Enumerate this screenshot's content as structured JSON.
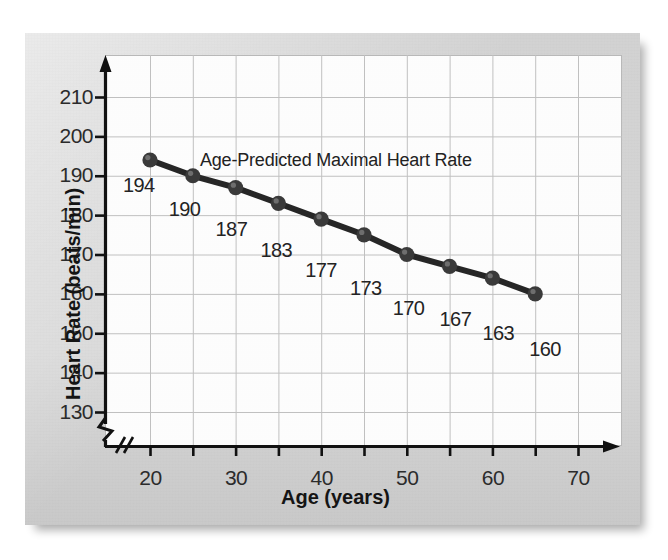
{
  "chart_data": {
    "type": "line",
    "title": "Age-Predicted Maximal Heart Rate",
    "xlabel": "Age (years)",
    "ylabel": "Heart Rate (beats/min)",
    "xlim": [
      15,
      72
    ],
    "ylim": [
      126,
      214
    ],
    "x": [
      20,
      25,
      30,
      35,
      40,
      45,
      50,
      55,
      60,
      65
    ],
    "values": [
      194,
      190,
      187,
      183,
      179,
      175,
      170,
      167,
      164,
      160
    ],
    "point_labels": [
      "194",
      "190",
      "187",
      "183",
      "177",
      "173",
      "170",
      "167",
      "163",
      "160"
    ],
    "xticks": [
      20,
      25,
      30,
      35,
      40,
      45,
      50,
      55,
      60,
      65,
      70
    ],
    "xtick_labels": [
      "20",
      "",
      "30",
      "",
      "40",
      "",
      "50",
      "",
      "60",
      "",
      "70"
    ],
    "yticks": [
      130,
      140,
      150,
      160,
      170,
      180,
      190,
      200,
      210
    ],
    "ytick_labels": [
      "130",
      "140",
      "150",
      "160",
      "170",
      "180",
      "190",
      "200",
      "210"
    ],
    "grid": true,
    "legend": false,
    "axis_break_x": true,
    "axis_break_y": true,
    "series_color": "#262626",
    "marker_color": "#3a3a3a",
    "grid_color": "#c0c0c0",
    "plot_bg": "#fdfdfd",
    "card_bg": "#d3d3d3"
  }
}
